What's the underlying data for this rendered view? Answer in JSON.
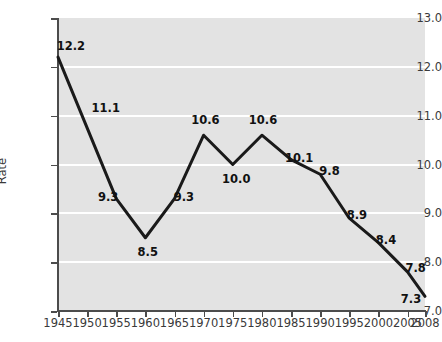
{
  "chart_data": {
    "type": "line",
    "title": "",
    "xlabel": "",
    "ylabel": "Rate",
    "xlim": [
      1945,
      2008
    ],
    "ylim": [
      7.0,
      13.0
    ],
    "grid": true,
    "legend": "none",
    "x_tick_labels": [
      "1945",
      "1950",
      "1955",
      "1960",
      "1965",
      "1970",
      "1975",
      "1980",
      "1985",
      "1990",
      "1995",
      "2000",
      "2005",
      "2008"
    ],
    "x_ticks": [
      1945,
      1950,
      1955,
      1960,
      1965,
      1970,
      1975,
      1980,
      1985,
      1990,
      1995,
      2000,
      2005,
      2008
    ],
    "y_tick_labels": [
      "13.0",
      "12.0",
      "11.0",
      "10.0",
      "9.0",
      "8.0",
      "7.0"
    ],
    "y_ticks": [
      13.0,
      12.0,
      11.0,
      10.0,
      9.0,
      8.0,
      7.0
    ],
    "x": [
      1945,
      1955,
      1960,
      1965,
      1970,
      1975,
      1980,
      1985,
      1990,
      1995,
      2000,
      2005,
      2008
    ],
    "values": [
      12.2,
      9.3,
      8.5,
      9.3,
      10.6,
      10.0,
      10.6,
      10.1,
      9.8,
      8.9,
      8.4,
      7.8,
      7.3
    ],
    "point_labels": [
      {
        "x": 1945,
        "y": 12.2,
        "text": "12.2",
        "lx": 1947.2,
        "ly": 12.42
      },
      {
        "x": 1952,
        "y": 10.6,
        "text": "11.1",
        "lx": 1953.2,
        "ly": 11.15
      },
      {
        "x": 1955,
        "y": 9.3,
        "text": "9.3",
        "lx": 1953.6,
        "ly": 9.34
      },
      {
        "x": 1960,
        "y": 8.5,
        "text": "8.5",
        "lx": 1960.4,
        "ly": 8.2
      },
      {
        "x": 1965,
        "y": 9.3,
        "text": "9.3",
        "lx": 1966.6,
        "ly": 9.34
      },
      {
        "x": 1970,
        "y": 10.6,
        "text": "10.6",
        "lx": 1970.3,
        "ly": 10.92
      },
      {
        "x": 1975,
        "y": 10.0,
        "text": "10.0",
        "lx": 1975.6,
        "ly": 9.7
      },
      {
        "x": 1980,
        "y": 10.6,
        "text": "10.6",
        "lx": 1980.2,
        "ly": 10.92
      },
      {
        "x": 1985,
        "y": 10.1,
        "text": "10.1",
        "lx": 1986.4,
        "ly": 10.14
      },
      {
        "x": 1990,
        "y": 9.8,
        "text": "9.8",
        "lx": 1991.6,
        "ly": 9.86
      },
      {
        "x": 1995,
        "y": 8.9,
        "text": "8.9",
        "lx": 1996.3,
        "ly": 8.96
      },
      {
        "x": 2000,
        "y": 8.4,
        "text": "8.4",
        "lx": 2001.3,
        "ly": 8.46
      },
      {
        "x": 2005,
        "y": 7.8,
        "text": "7.8",
        "lx": 2006.4,
        "ly": 7.88
      },
      {
        "x": 2008,
        "y": 7.3,
        "text": "7.3",
        "lx": 2005.6,
        "ly": 7.24
      }
    ],
    "line_color": "#1a1a1a",
    "plot_background": "#e3e3e3",
    "gridline_color": "#ffffff",
    "axis_color": "#4c4c4c"
  }
}
